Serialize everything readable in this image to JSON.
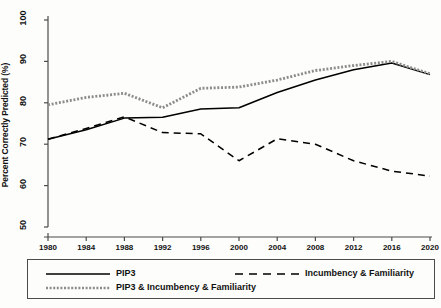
{
  "chart_data": {
    "type": "line",
    "title": "",
    "xlabel": "",
    "ylabel": "Percent Correctly Predicted (%)",
    "x": [
      1980,
      1984,
      1988,
      1992,
      1996,
      2000,
      2004,
      2008,
      2012,
      2016,
      2020
    ],
    "xticklabels": [
      "1980",
      "1984",
      "1988",
      "1992",
      "1996",
      "2000",
      "2004",
      "2008",
      "2012",
      "2016",
      "2020"
    ],
    "yticklabels": [
      "50",
      "60",
      "70",
      "80",
      "90",
      "100"
    ],
    "yticks": [
      50,
      60,
      70,
      80,
      90,
      100
    ],
    "ylim": [
      50,
      100
    ],
    "xlim": [
      1980,
      2020
    ],
    "grid": false,
    "axis_break_below_y": 50,
    "legend_position": "below-plot",
    "series": [
      {
        "name": "PIP3",
        "style": "solid",
        "color": "#000000",
        "values": [
          71.2,
          73.5,
          76.3,
          76.5,
          78.5,
          78.8,
          82.5,
          85.5,
          88.0,
          89.6,
          86.8
        ]
      },
      {
        "name": "Incumbency & Familiarity",
        "style": "dashed",
        "color": "#000000",
        "values": [
          71.2,
          73.8,
          76.6,
          72.8,
          72.5,
          66.0,
          71.3,
          70.0,
          66.0,
          63.5,
          62.3
        ]
      },
      {
        "name": "PIP3 & Incumbency & Familiarity",
        "style": "dotted",
        "color": "#8c8c8c",
        "values": [
          79.5,
          81.3,
          82.3,
          78.8,
          83.5,
          83.8,
          85.5,
          87.8,
          89.0,
          90.0,
          87.0
        ]
      }
    ]
  },
  "legend": {
    "entries": [
      {
        "label": "PIP3",
        "style": "solid"
      },
      {
        "label": "Incumbency & Familiarity",
        "style": "dashed"
      },
      {
        "label": "PIP3 & Incumbency & Familiarity",
        "style": "dotted"
      }
    ]
  }
}
